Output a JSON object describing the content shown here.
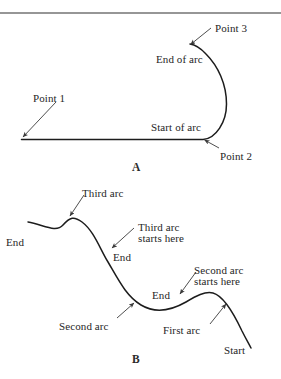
{
  "figure": {
    "panels": [
      {
        "id": "panel-a",
        "letter": "A",
        "letter_x": 132,
        "letter_y": 161,
        "labels": [
          {
            "name": "label-point-3",
            "text": "Point 3",
            "x": 215,
            "y": 23
          },
          {
            "name": "label-end-of-arc",
            "text": "End of arc",
            "x": 156,
            "y": 54
          },
          {
            "name": "label-point-1",
            "text": "Point 1",
            "x": 33,
            "y": 93
          },
          {
            "name": "label-start-of-arc",
            "text": "Start of arc",
            "x": 151,
            "y": 122
          },
          {
            "name": "label-point-2",
            "text": "Point 2",
            "x": 220,
            "y": 151
          }
        ]
      },
      {
        "id": "panel-b",
        "letter": "B",
        "letter_x": 132,
        "letter_y": 353,
        "labels": [
          {
            "name": "label-third-arc",
            "text": "Third arc",
            "x": 82,
            "y": 188
          },
          {
            "name": "label-third-arc-starts-here-line1",
            "text": "Third arc",
            "x": 138,
            "y": 222
          },
          {
            "name": "label-third-arc-starts-here-line2",
            "text": "starts here",
            "x": 138,
            "y": 233
          },
          {
            "name": "label-end-left",
            "text": "End",
            "x": 6,
            "y": 237
          },
          {
            "name": "label-end-middle",
            "text": "End",
            "x": 113,
            "y": 252
          },
          {
            "name": "label-second-arc-starts-here-line1",
            "text": "Second arc",
            "x": 194,
            "y": 265
          },
          {
            "name": "label-second-arc-starts-here-line2",
            "text": "starts here",
            "x": 194,
            "y": 276
          },
          {
            "name": "label-end-right",
            "text": "End",
            "x": 152,
            "y": 290
          },
          {
            "name": "label-second-arc",
            "text": "Second arc",
            "x": 59,
            "y": 321
          },
          {
            "name": "label-first-arc",
            "text": "First arc",
            "x": 163,
            "y": 325
          },
          {
            "name": "label-start",
            "text": "Start",
            "x": 224,
            "y": 345
          }
        ]
      }
    ],
    "colors": {
      "stroke": "#1c1c1c",
      "arrow_stroke": "#3a3a3a",
      "rule": "#2e2e2e",
      "background": "#ffffff"
    },
    "geometry": {
      "top_rule": {
        "name": "top-divider-rule",
        "x1": 0,
        "y1": 13,
        "x2": 281,
        "y2": 13
      },
      "panel_a_path": "M 21.5 139.5 L 203 139.5 C 216 138.5 226.5 122 226.5 104 C 226.5 84 218 66 206 54 C 200 47.5 194 44.5 190 44",
      "panel_b_path": "M 28 222 C 44 225 56 233 63 225 C 70 217 74 216 82 222 C 94 231 100 249 108 262 C 118 279 126 296 141 305 C 156 314 172 310 186 302 C 196 296 205 291 213 293 C 224 296 234 314 242 331 C 246 339 249 344 251 348",
      "arrows": [
        {
          "name": "arrow-point-3",
          "x1": 211,
          "y1": 28,
          "x2": 190.5,
          "y2": 44.5
        },
        {
          "name": "arrow-point-1",
          "x1": 56,
          "y1": 102,
          "x2": 23,
          "y2": 137
        },
        {
          "name": "arrow-point-2",
          "x1": 219,
          "y1": 148,
          "x2": 204.5,
          "y2": 140
        },
        {
          "name": "arrow-third-arc",
          "x1": 84,
          "y1": 195,
          "x2": 70,
          "y2": 216
        },
        {
          "name": "arrow-third-arc-starts-here",
          "x1": 134,
          "y1": 228,
          "x2": 112,
          "y2": 248
        },
        {
          "name": "arrow-second-arc-starts-here",
          "x1": 196,
          "y1": 272,
          "x2": 180,
          "y2": 294
        },
        {
          "name": "arrow-second-arc",
          "x1": 117,
          "y1": 318,
          "x2": 134,
          "y2": 303
        },
        {
          "name": "arrow-first-arc",
          "x1": 210,
          "y1": 324,
          "x2": 226,
          "y2": 304
        }
      ]
    }
  }
}
